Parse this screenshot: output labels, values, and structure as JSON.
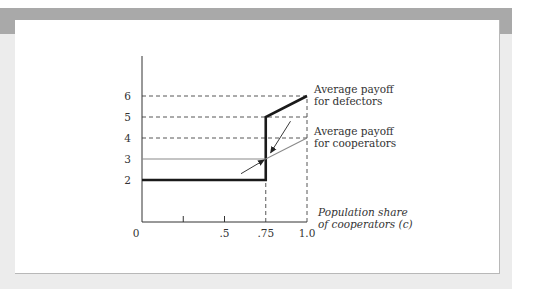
{
  "chart_data": {
    "type": "line",
    "title": "",
    "xlabel": "Population share of cooperators (c)",
    "xlabel_lines": [
      "Population share",
      "of cooperators (c)"
    ],
    "ylabel": "",
    "xlim": [
      0,
      1.0
    ],
    "ylim": [
      0,
      7.9
    ],
    "x_ticks": [
      0,
      0.25,
      0.5,
      0.75,
      1.0
    ],
    "x_tick_labels": [
      "0",
      "",
      ".5",
      ".75",
      "1.0"
    ],
    "y_ticks": [
      2,
      3,
      4,
      5,
      6
    ],
    "y_tick_labels": [
      "2",
      "3",
      "4",
      "5",
      "6"
    ],
    "grid": false,
    "series": [
      {
        "name": "Average payoff for defectors",
        "label_lines": [
          "Average payoff",
          "for defectors"
        ],
        "style": "thick-black",
        "color": "#1a1a1a",
        "points": [
          [
            0,
            2
          ],
          [
            0.75,
            2
          ],
          [
            0.75,
            5
          ],
          [
            1.0,
            6
          ]
        ]
      },
      {
        "name": "Average payoff for cooperators",
        "label_lines": [
          "Average payoff",
          "for cooperators"
        ],
        "style": "thin-gray",
        "color": "#8a8a8a",
        "points": [
          [
            0,
            3
          ],
          [
            0.75,
            3
          ],
          [
            1.0,
            4
          ]
        ]
      }
    ],
    "reference_lines": {
      "horizontal_dashed": [
        {
          "y": 6,
          "x_to": 1.0
        },
        {
          "y": 5,
          "x_to": 1.0
        },
        {
          "y": 4,
          "x_to": 1.0
        }
      ],
      "vertical_dashed": [
        {
          "x": 0.75,
          "y_from": 0,
          "y_to": 5
        },
        {
          "x": 1.0,
          "y_from": 0,
          "y_to": 6
        }
      ]
    },
    "annotations": [
      {
        "type": "arrow",
        "description": "arrow pointing down-left toward vertical jump at c=.75",
        "from": [
          0.9,
          4.8
        ],
        "to": [
          0.78,
          3.3
        ]
      },
      {
        "type": "arrow",
        "description": "arrow pointing up-right toward intersection at c=.75, payoff 3",
        "from": [
          0.6,
          2.3
        ],
        "to": [
          0.74,
          2.95
        ]
      }
    ]
  }
}
